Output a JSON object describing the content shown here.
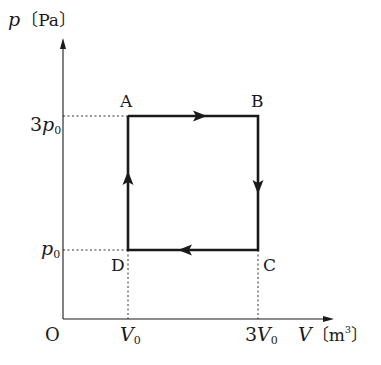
{
  "diagram": {
    "type": "p-V cycle diagram",
    "y_axis": {
      "symbol": "p",
      "unit": "Pa",
      "label": "p〔Pa〕"
    },
    "x_axis": {
      "symbol": "V",
      "unit": "m³",
      "label": "V〔m³〕"
    },
    "origin_label": "O",
    "y_ticks": [
      {
        "coef": "3",
        "sym": "p",
        "sub": "0",
        "value": "3p₀"
      },
      {
        "coef": "",
        "sym": "p",
        "sub": "0",
        "value": "p₀"
      }
    ],
    "x_ticks": [
      {
        "coef": "",
        "sym": "V",
        "sub": "0",
        "value": "V₀"
      },
      {
        "coef": "3",
        "sym": "V",
        "sub": "0",
        "value": "3V₀"
      }
    ],
    "points": [
      {
        "name": "A",
        "V": "V0",
        "p": "3p0"
      },
      {
        "name": "B",
        "V": "3V0",
        "p": "3p0"
      },
      {
        "name": "C",
        "V": "3V0",
        "p": "p0"
      },
      {
        "name": "D",
        "V": "V0",
        "p": "p0"
      }
    ],
    "cycle": [
      "A",
      "B",
      "C",
      "D",
      "A"
    ],
    "direction": "clockwise",
    "colors": {
      "line": "#1a1a1a",
      "background": "#ffffff"
    }
  }
}
